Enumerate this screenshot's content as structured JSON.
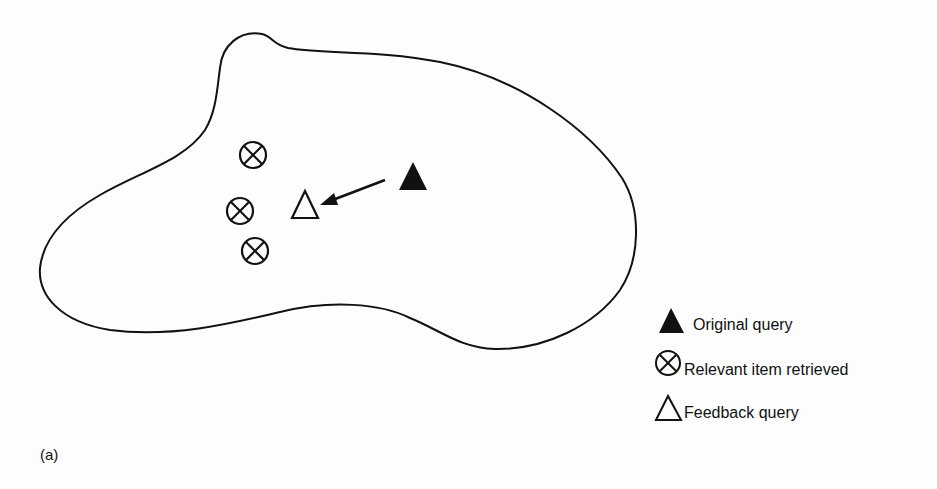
{
  "figure": {
    "caption": "(a)"
  },
  "diagram": {
    "region": "document space (closed blob outline)",
    "nodes": [
      {
        "id": "relevant-1",
        "type": "relevant_item_retrieved",
        "symbol": "circle-x",
        "x": 253,
        "y": 155
      },
      {
        "id": "relevant-2",
        "type": "relevant_item_retrieved",
        "symbol": "circle-x",
        "x": 240,
        "y": 211
      },
      {
        "id": "relevant-3",
        "type": "relevant_item_retrieved",
        "symbol": "circle-x",
        "x": 255,
        "y": 251
      },
      {
        "id": "feedback-query",
        "type": "feedback_query",
        "symbol": "open-triangle",
        "x": 305,
        "y": 206
      },
      {
        "id": "original-query",
        "type": "original_query",
        "symbol": "filled-triangle",
        "x": 413,
        "y": 177
      }
    ],
    "edges": [
      {
        "from": "original-query",
        "to": "feedback-query",
        "style": "arrow"
      }
    ]
  },
  "legend": {
    "items": [
      {
        "symbol": "filled-triangle",
        "label": "Original query"
      },
      {
        "symbol": "circle-x",
        "label": "Relevant item retrieved"
      },
      {
        "symbol": "open-triangle",
        "label": "Feedback query"
      }
    ]
  },
  "colors": {
    "ink": "#111111",
    "background": "#fdfdfd"
  }
}
